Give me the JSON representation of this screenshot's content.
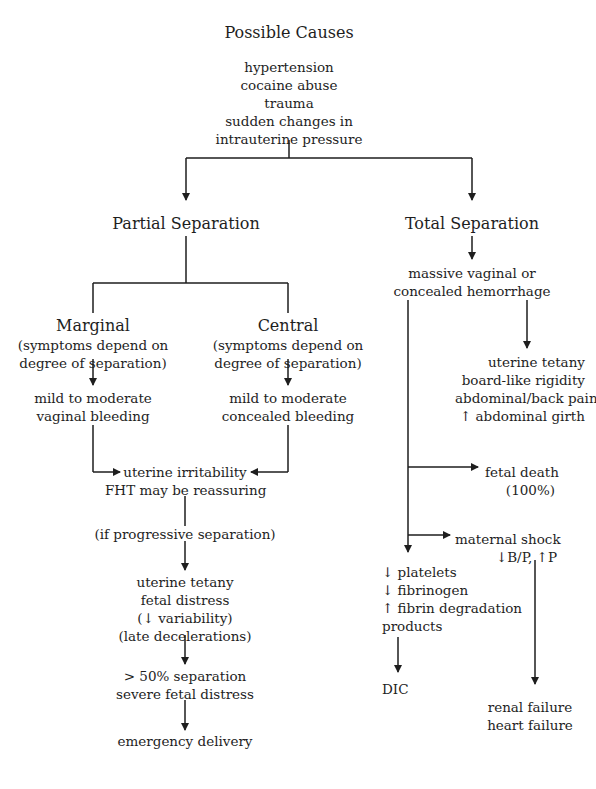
{
  "diagram": {
    "title": "Possible Causes",
    "causes": [
      "hypertension",
      "cocaine abuse",
      "trauma",
      "sudden changes in",
      "intrauterine pressure"
    ],
    "partial": {
      "title": "Partial Separation",
      "marginal": {
        "title": "Marginal",
        "note": [
          "(symptoms depend on",
          "degree of separation)"
        ],
        "result": [
          "mild to moderate",
          "vaginal bleeding"
        ]
      },
      "central": {
        "title": "Central",
        "note": [
          "(symptoms depend on",
          "degree of separation)"
        ],
        "result": [
          "mild to moderate",
          "concealed bleeding"
        ]
      },
      "irritability": [
        "uterine irritability",
        "FHT may be reassuring"
      ],
      "condition": "(if progressive separation)",
      "tetany": [
        "uterine tetany",
        "fetal distress",
        "(↓ variability)",
        "(late decelerations)"
      ],
      "severe": [
        "> 50% separation",
        "severe fetal distress"
      ],
      "outcome": "emergency delivery"
    },
    "total": {
      "title": "Total Separation",
      "hemorrhage": [
        "massive vaginal or",
        "concealed hemorrhage"
      ],
      "tetany": [
        "uterine tetany",
        "board-like rigidity",
        "abdominal/back pain",
        "↑ abdominal girth"
      ],
      "fetal_death": [
        "fetal death",
        "(100%)"
      ],
      "maternal_shock": [
        "maternal shock",
        "↓B/P, ↑P"
      ],
      "coagulation": [
        "↓ platelets",
        "↓ fibrinogen",
        "↑ fibrin degradation",
        "products"
      ],
      "dic": "DIC",
      "failure": [
        "renal failure",
        "heart failure"
      ]
    }
  },
  "style": {
    "line_color": "#1e1e1e",
    "background": "#ffffff"
  }
}
